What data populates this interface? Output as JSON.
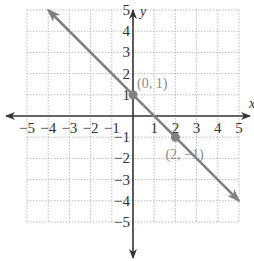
{
  "chart_data": {
    "type": "line",
    "title": "",
    "xlabel": "x",
    "ylabel": "y",
    "xlim": [
      -5,
      5
    ],
    "ylim": [
      -5,
      5
    ],
    "grid": true,
    "x_ticks": [
      "-5",
      "-4",
      "-3",
      "-2",
      "-1",
      "1",
      "2",
      "3",
      "4",
      "5"
    ],
    "y_ticks": [
      "5",
      "4",
      "3",
      "2",
      "1",
      "-1",
      "-2",
      "-3",
      "-4",
      "-5"
    ],
    "series": [
      {
        "name": "y = -x + 1",
        "x": [
          -4,
          5
        ],
        "y": [
          5,
          -4
        ],
        "arrows": "both"
      }
    ],
    "points": [
      {
        "x": 0,
        "y": 1,
        "label": "(0, 1)"
      },
      {
        "x": 2,
        "y": -1,
        "label": "(2, −1)"
      }
    ],
    "colors": {
      "line": "#808080",
      "axis": "#333333",
      "grid": "#bbbbbb",
      "point_label": "#8a8a8a"
    }
  }
}
